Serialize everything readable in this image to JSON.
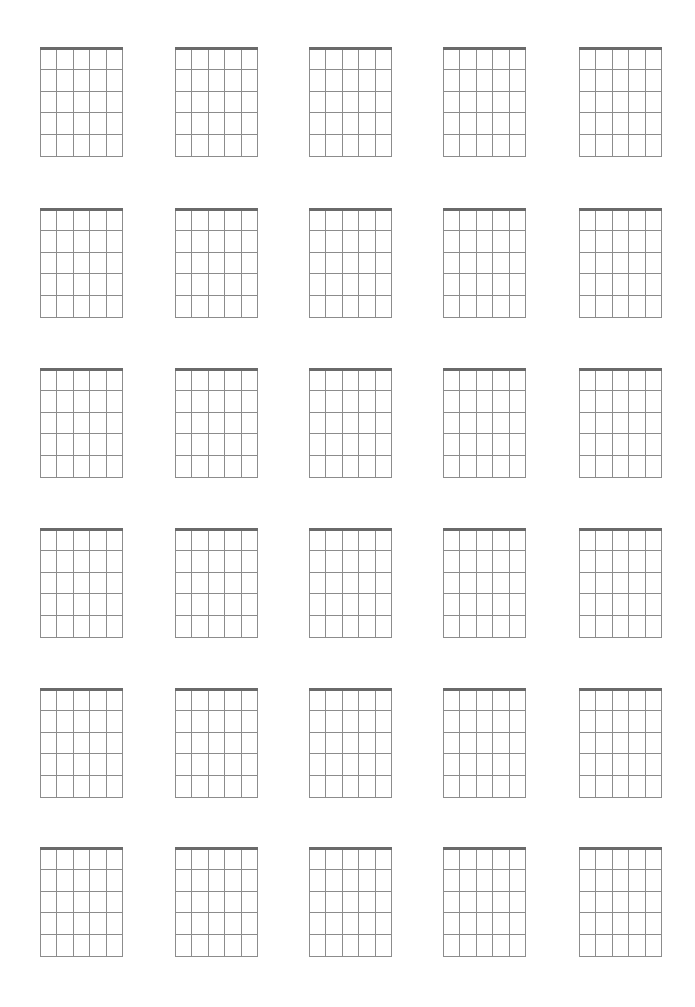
{
  "page": {
    "rows": 6,
    "columns": 5,
    "col_x": [
      40,
      175,
      309,
      443,
      579
    ],
    "row_y": [
      47,
      208,
      368,
      528,
      688,
      847
    ],
    "diagram": {
      "strings": 6,
      "frets": 5,
      "width": 83,
      "height": 110
    },
    "colors": {
      "nut": "#6a6a6a",
      "grid": "#8c8c8c",
      "background": "#ffffff"
    }
  }
}
